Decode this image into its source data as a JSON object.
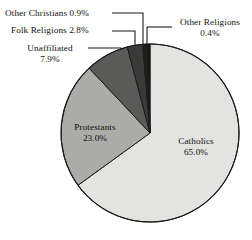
{
  "chart_data": {
    "type": "pie",
    "title": "",
    "xlabel": "",
    "ylabel": "",
    "unit": "%",
    "legend_position": "none",
    "grid": false,
    "labels_inside": [
      "Catholics",
      "Protestants"
    ],
    "labels_outside": [
      "Unaffiliated",
      "Folk Religions",
      "Other Christians",
      "Other Religions"
    ],
    "start_angle_deg": -90,
    "direction": "clockwise",
    "categories": [
      "Catholics",
      "Protestants",
      "Unaffiliated",
      "Folk Religions",
      "Other Christians",
      "Other Religions"
    ],
    "values": [
      65.0,
      23.0,
      7.9,
      2.8,
      0.9,
      0.4
    ],
    "colors": [
      "#e3e3e0",
      "#ababa7",
      "#5a5a59",
      "#3a3a39",
      "#1d1d1c",
      "#141413"
    ],
    "slices": [
      {
        "name": "Catholics",
        "value": 65.0,
        "label": "Catholics",
        "value_text": "65.0%",
        "color": "#e3e3e0",
        "label_placement": "inside"
      },
      {
        "name": "Protestants",
        "value": 23.0,
        "label": "Protestants",
        "value_text": "23.0%",
        "color": "#ababa7",
        "label_placement": "inside"
      },
      {
        "name": "Unaffiliated",
        "value": 7.9,
        "label": "Unaffiliated",
        "value_text": "7.9%",
        "color": "#5a5a59",
        "label_placement": "outside"
      },
      {
        "name": "Folk Religions",
        "value": 2.8,
        "label": "Folk Religions",
        "value_text": "2.8%",
        "color": "#3a3a39",
        "label_placement": "outside"
      },
      {
        "name": "Other Christians",
        "value": 0.9,
        "label": "Other Christians",
        "value_text": "0.9%",
        "color": "#1d1d1c",
        "label_placement": "outside"
      },
      {
        "name": "Other Religions",
        "value": 0.4,
        "label": "Other Religions",
        "value_text": "0.4%",
        "color": "#141413",
        "label_placement": "outside"
      }
    ]
  },
  "labels": {
    "other_christians": {
      "text": "Other Christians 0.9%",
      "name": "Other Christians",
      "value": "0.9%"
    },
    "folk_religions": {
      "text": "Folk Religions 2.8%",
      "name": "Folk Religions",
      "value": "2.8%"
    },
    "unaffiliated": {
      "name": "Unaffiliated",
      "value": "7.9%"
    },
    "other_religions": {
      "name": "Other Religions",
      "value": "0.4%"
    },
    "protestants": {
      "name": "Protestants",
      "value": "23.0%"
    },
    "catholics": {
      "name": "Catholics",
      "value": "65.0%"
    }
  },
  "style": {
    "background": "#ffffff",
    "text_color": "#111111",
    "outline_color": "#1a1a1a"
  }
}
